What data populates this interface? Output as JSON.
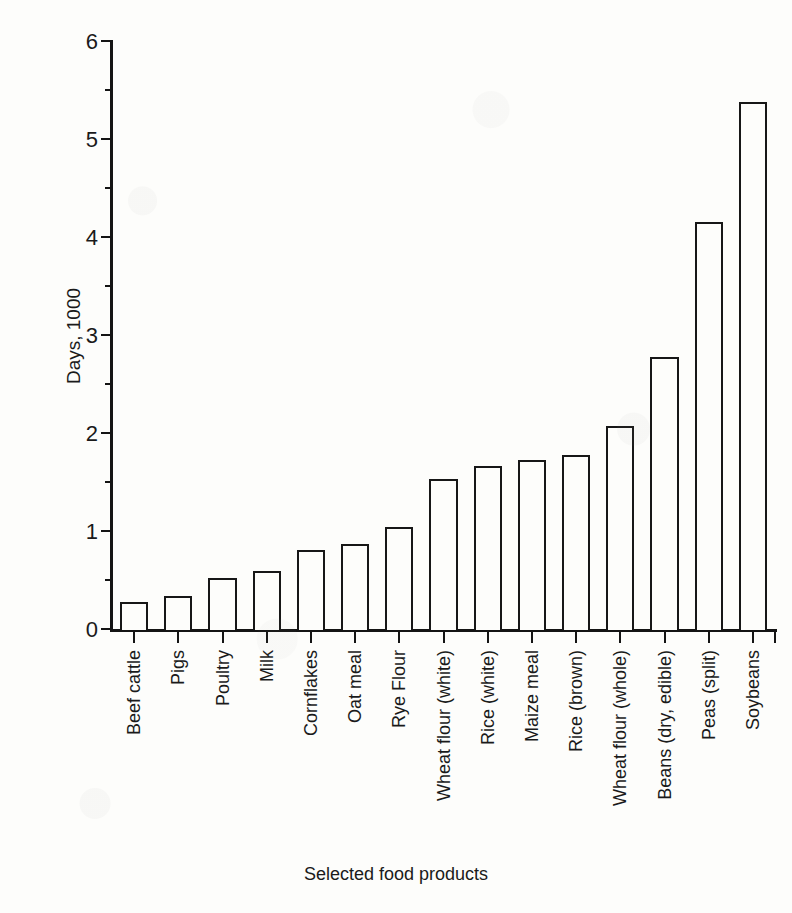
{
  "chart_data": {
    "type": "bar",
    "title": "",
    "xlabel": "Selected food products",
    "ylabel": "Days, 1000",
    "ylim": [
      0,
      6
    ],
    "ytick_labels": [
      "0",
      "1",
      "2",
      "3",
      "4",
      "5",
      "6"
    ],
    "ytick_values": [
      0,
      1,
      2,
      3,
      4,
      5,
      6
    ],
    "yminor_values": [
      0.5,
      1.5,
      2.5,
      3.5,
      4.5,
      5.5
    ],
    "grid": false,
    "legend": null,
    "bar_style": {
      "fill": "#fdfdfb",
      "edge": "#171717"
    },
    "categories": [
      "Beef cattle",
      "Pigs",
      "Poultry",
      "Milk",
      "Cornflakes",
      "Oat meal",
      "Rye Flour",
      "Wheat flour (white)",
      "Rice (white)",
      "Maize meal",
      "Rice (brown)",
      "Wheat flour (whole)",
      "Beans (dry, edible)",
      "Peas (split)",
      "Soybeans"
    ],
    "values": [
      0.29,
      0.35,
      0.53,
      0.6,
      0.82,
      0.88,
      1.05,
      1.54,
      1.67,
      1.73,
      1.79,
      2.08,
      2.79,
      4.16,
      5.39
    ]
  }
}
